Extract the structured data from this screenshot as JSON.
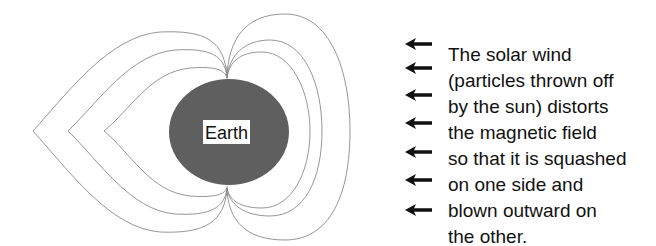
{
  "diagram": {
    "earth_label": "Earth",
    "colors": {
      "earth": "#5f5f5f",
      "field_lines": "#8a8a8a",
      "arrows": "#111111",
      "text": "#111111"
    },
    "arrow_count": 7,
    "arrow_icon": "left-arrow-icon"
  },
  "caption": {
    "lines": [
      "The solar wind",
      "(particles thrown off",
      "by the sun) distorts",
      "the magnetic field",
      "so that it is squashed",
      "on one side and",
      "blown outward on",
      "the other."
    ]
  }
}
